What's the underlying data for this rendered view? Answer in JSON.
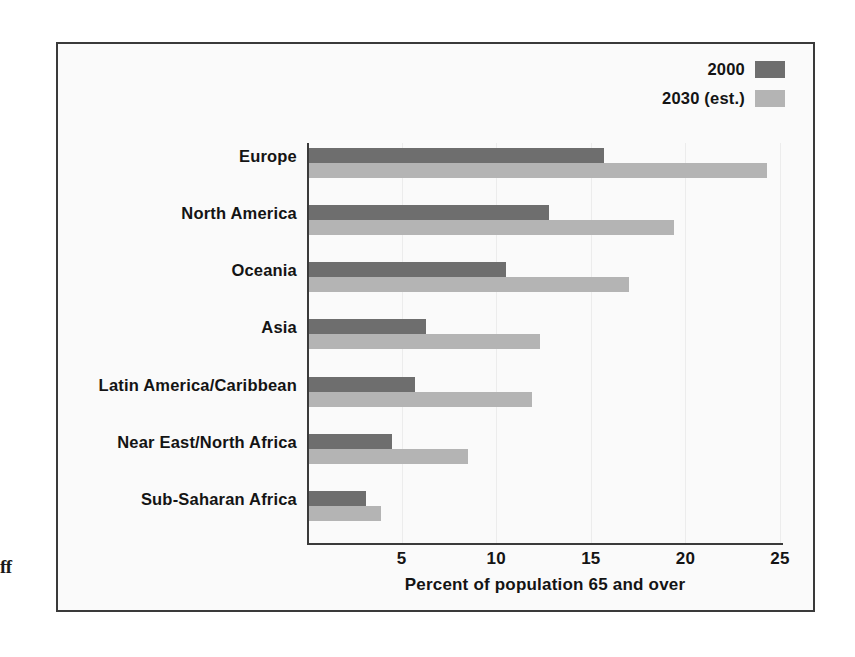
{
  "margin_fragment": "ff",
  "legend": {
    "position": "top-right",
    "entries": [
      {
        "label": "2000",
        "color": "#6e6e6e"
      },
      {
        "label": "2030 (est.)",
        "color": "#b4b4b4"
      }
    ]
  },
  "axis": {
    "x_title": "Percent of population 65 and over",
    "x_ticks": [
      "5",
      "10",
      "15",
      "20",
      "25"
    ]
  },
  "chart_data": {
    "type": "bar",
    "orientation": "horizontal",
    "title": "",
    "subtitle": "",
    "xlabel": "Percent of population 65 and over",
    "ylabel": "",
    "xlim": [
      0,
      25
    ],
    "xticks": [
      5,
      10,
      15,
      20,
      25
    ],
    "grid": false,
    "legend_position": "top-right",
    "categories": [
      "Europe",
      "North America",
      "Oceania",
      "Asia",
      "Latin America/Caribbean",
      "Near East/North Africa",
      "Sub-Saharan Africa"
    ],
    "series": [
      {
        "name": "2000",
        "color": "#6e6e6e",
        "values": [
          15.6,
          12.7,
          10.4,
          6.2,
          5.6,
          4.4,
          3.0
        ]
      },
      {
        "name": "2030 (est.)",
        "color": "#b4b4b4",
        "values": [
          24.2,
          19.3,
          16.9,
          12.2,
          11.8,
          8.4,
          3.8
        ]
      }
    ]
  }
}
